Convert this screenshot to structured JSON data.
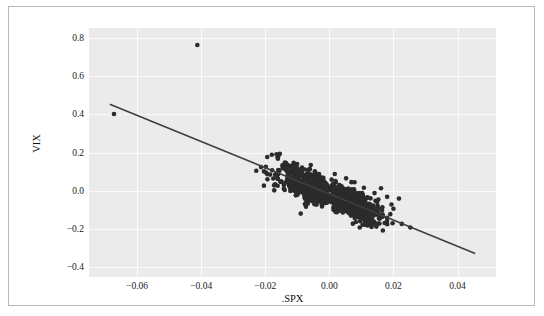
{
  "figure": {
    "background": "#ffffff",
    "border_color": "#b9b9b9",
    "panel_background": "#ebebeb",
    "grid_color": "#fbfbfb"
  },
  "chart_data": {
    "type": "scatter",
    "title": "",
    "xlabel": ".SPX",
    "ylabel": "VIX",
    "xlim": [
      -0.075,
      0.052
    ],
    "ylim": [
      -0.45,
      0.85
    ],
    "xticks": [
      "-0.06",
      "-0.04",
      "-0.02",
      "0.00",
      "0.02",
      "0.04"
    ],
    "xtick_values": [
      -0.06,
      -0.04,
      -0.02,
      0.0,
      0.02,
      0.04
    ],
    "yticks": [
      "0.8",
      "0.6",
      "0.4",
      "0.2",
      "0.0",
      "-0.2",
      "-0.4"
    ],
    "ytick_values": [
      0.8,
      0.6,
      0.4,
      0.2,
      0.0,
      -0.2,
      -0.4
    ],
    "grid": true,
    "legend": "none",
    "marker_color": "#2b2b2b",
    "marker_size": 2.3,
    "n_points": 1240,
    "fit_line": {
      "color": "#3f3f3f",
      "width": 1.6,
      "x_start": -0.0685,
      "y_start": 0.452,
      "x_end": 0.0455,
      "y_end": -0.327,
      "slope": -6.83,
      "intercept": -0.0153
    },
    "annotations": [
      {
        "label": "outlier",
        "x": -0.0412,
        "y": 0.761
      },
      {
        "label": "outlier",
        "x": -0.0672,
        "y": 0.401
      }
    ]
  }
}
